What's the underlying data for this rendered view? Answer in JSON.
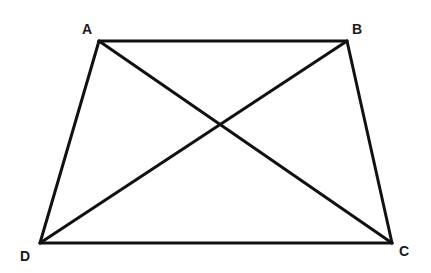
{
  "diagram": {
    "type": "geometry",
    "shape": "trapezoid",
    "name": "ABCD",
    "vertices": [
      {
        "id": "A",
        "label": "A",
        "x": 99,
        "y": 41,
        "label_x": 87,
        "label_y": 34
      },
      {
        "id": "B",
        "label": "B",
        "x": 347,
        "y": 41,
        "label_x": 357,
        "label_y": 34
      },
      {
        "id": "C",
        "label": "C",
        "x": 392,
        "y": 243,
        "label_x": 404,
        "label_y": 256
      },
      {
        "id": "D",
        "label": "D",
        "x": 40,
        "y": 243,
        "label_x": 25,
        "label_y": 261
      }
    ],
    "edges": [
      {
        "id": "AB",
        "from": "A",
        "to": "B",
        "kind": "side"
      },
      {
        "id": "BC",
        "from": "B",
        "to": "C",
        "kind": "side"
      },
      {
        "id": "CD",
        "from": "C",
        "to": "D",
        "kind": "side"
      },
      {
        "id": "DA",
        "from": "D",
        "to": "A",
        "kind": "side"
      },
      {
        "id": "AC",
        "from": "A",
        "to": "C",
        "kind": "diagonal"
      },
      {
        "id": "BD",
        "from": "B",
        "to": "D",
        "kind": "diagonal"
      }
    ],
    "colors": {
      "line": "#111111",
      "label": "#1a1a1a",
      "background": "#ffffff"
    }
  }
}
